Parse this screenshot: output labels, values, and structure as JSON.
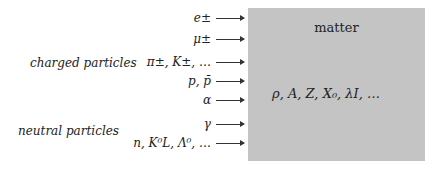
{
  "diagram": {
    "groups": [
      {
        "label": "charged particles"
      },
      {
        "label": "neutral particles"
      }
    ],
    "particles": [
      {
        "label": "e±"
      },
      {
        "label": "μ±"
      },
      {
        "label": "π±, K±, …"
      },
      {
        "label": "p, p̄"
      },
      {
        "label": "α"
      },
      {
        "label": "γ"
      },
      {
        "label": "n, K⁰L, Λ⁰, …"
      }
    ],
    "target": {
      "title": "matter",
      "properties": "ρ, A, Z, X₀, λI, …",
      "fill_color": "#c4c4c4"
    }
  }
}
